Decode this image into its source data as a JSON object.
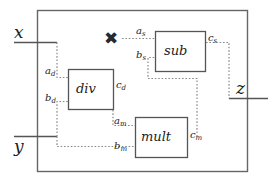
{
  "diagram": {
    "outer_border": {
      "label": "outer-module-boundary"
    },
    "colors": {
      "stroke": "#555555",
      "wire": "#888888",
      "text": "#1c1c1c",
      "background": "#ffffff"
    },
    "inputs": [
      {
        "name": "x",
        "label": "x"
      },
      {
        "name": "y",
        "label": "y"
      }
    ],
    "outputs": [
      {
        "name": "z",
        "label": "z"
      }
    ],
    "marker": {
      "name": "cross-mark",
      "label": "✖",
      "meaning": "disconnected-input"
    },
    "blocks": [
      {
        "id": "div",
        "label": "div",
        "ports": {
          "a": "a",
          "a_sub": "d",
          "b": "b",
          "b_sub": "d",
          "c": "c",
          "c_sub": "d"
        }
      },
      {
        "id": "sub",
        "label": "sub",
        "ports": {
          "a": "a",
          "a_sub": "s",
          "b": "b",
          "b_sub": "s",
          "c": "c",
          "c_sub": "s"
        }
      },
      {
        "id": "mult",
        "label": "mult",
        "ports": {
          "a": "a",
          "a_sub": "m",
          "b": "b",
          "b_sub": "m",
          "c": "c",
          "c_sub": "m"
        }
      }
    ],
    "port_labels": {
      "a_d": {
        "base": "a",
        "sub": "d"
      },
      "b_d": {
        "base": "b",
        "sub": "d"
      },
      "c_d": {
        "base": "c",
        "sub": "d"
      },
      "a_s": {
        "base": "a",
        "sub": "s"
      },
      "b_s": {
        "base": "b",
        "sub": "s"
      },
      "c_s": {
        "base": "c",
        "sub": "s"
      },
      "a_m": {
        "base": "a",
        "sub": "m"
      },
      "b_m": {
        "base": "b",
        "sub": "m"
      },
      "c_m": {
        "base": "c",
        "sub": "m"
      }
    }
  }
}
